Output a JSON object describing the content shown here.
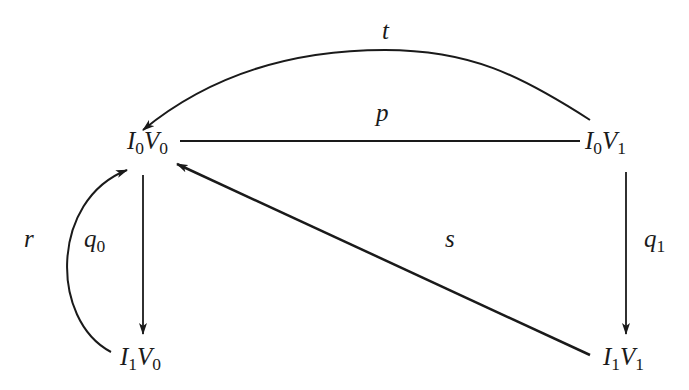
{
  "diagram": {
    "nodes": {
      "i0v0": {
        "i": "I",
        "i_sub": "0",
        "v": "V",
        "v_sub": "0"
      },
      "i0v1": {
        "i": "I",
        "i_sub": "0",
        "v": "V",
        "v_sub": "1"
      },
      "i1v0": {
        "i": "I",
        "i_sub": "1",
        "v": "V",
        "v_sub": "0"
      },
      "i1v1": {
        "i": "I",
        "i_sub": "1",
        "v": "V",
        "v_sub": "1"
      }
    },
    "edges": {
      "t": {
        "label": "t",
        "from": "I0V1",
        "to": "I0V0",
        "style": "curved-arrow"
      },
      "p": {
        "label": "p",
        "from": "I0V0",
        "to": "I0V1",
        "style": "line"
      },
      "q0": {
        "label": "q",
        "label_sub": "0",
        "from": "I0V0",
        "to": "I1V0",
        "style": "arrow"
      },
      "q1": {
        "label": "q",
        "label_sub": "1",
        "from": "I0V1",
        "to": "I1V1",
        "style": "arrow"
      },
      "s": {
        "label": "s",
        "from": "I1V1",
        "to": "I0V0",
        "style": "arrow"
      },
      "r": {
        "label": "r",
        "from": "I1V0",
        "to": "I0V0",
        "style": "curved-arrow"
      }
    },
    "colors": {
      "ink": "#1a1a1a",
      "background": "#ffffff"
    }
  }
}
